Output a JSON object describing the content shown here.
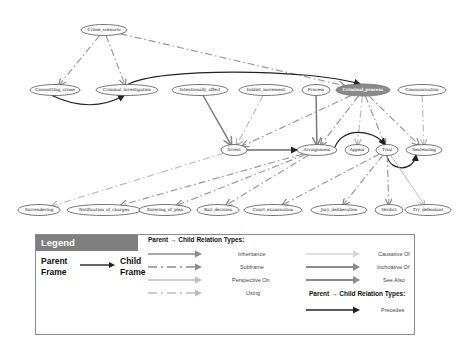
{
  "diagram": {
    "nodes": [
      {
        "id": "crime_scenario",
        "label": "Crime_scenario",
        "x": 104,
        "y": 30,
        "rx": 23,
        "ry": 5.5
      },
      {
        "id": "committing_crime",
        "label": "Committing_crime",
        "x": 55,
        "y": 90,
        "rx": 25,
        "ry": 5.5
      },
      {
        "id": "criminal_investigation",
        "label": "Criminal_investigation",
        "x": 127,
        "y": 90,
        "rx": 31,
        "ry": 5.5
      },
      {
        "id": "intentionally_affect",
        "label": "Intentionally_affect",
        "x": 200,
        "y": 90,
        "rx": 28,
        "ry": 5.5
      },
      {
        "id": "inhibit_movement",
        "label": "Inhibit_movement",
        "x": 266,
        "y": 90,
        "rx": 27,
        "ry": 5.5
      },
      {
        "id": "process",
        "label": "Process",
        "x": 316,
        "y": 90,
        "rx": 14,
        "ry": 5.5
      },
      {
        "id": "criminal_process",
        "label": "Criminal_process",
        "x": 363,
        "y": 90,
        "rx": 27,
        "ry": 6,
        "highlight": true
      },
      {
        "id": "communication",
        "label": "Communication",
        "x": 422,
        "y": 90,
        "rx": 24,
        "ry": 5.5
      },
      {
        "id": "arrest",
        "label": "Arrest",
        "x": 234,
        "y": 150,
        "rx": 13,
        "ry": 5.5
      },
      {
        "id": "arraignment",
        "label": "Arraignment",
        "x": 317,
        "y": 150,
        "rx": 20,
        "ry": 5.5
      },
      {
        "id": "appeal",
        "label": "Appeal",
        "x": 357,
        "y": 150,
        "rx": 12,
        "ry": 5.5
      },
      {
        "id": "trial",
        "label": "Trial",
        "x": 387,
        "y": 150,
        "rx": 11,
        "ry": 5.5
      },
      {
        "id": "sentencing",
        "label": "Sentencing",
        "x": 424,
        "y": 150,
        "rx": 18,
        "ry": 5.5
      },
      {
        "id": "surrendering",
        "label": "Surrendering",
        "x": 39,
        "y": 210,
        "rx": 21,
        "ry": 5.5
      },
      {
        "id": "notification_of_charges",
        "label": "Notification_of_charges",
        "x": 104,
        "y": 210,
        "rx": 37,
        "ry": 5.5
      },
      {
        "id": "entering_of_plea",
        "label": "Entering_of_plea",
        "x": 165,
        "y": 210,
        "rx": 26,
        "ry": 5.5
      },
      {
        "id": "bail_decision",
        "label": "Bail_decision",
        "x": 218,
        "y": 210,
        "rx": 21,
        "ry": 5.5
      },
      {
        "id": "court_examination",
        "label": "Court_examination",
        "x": 273,
        "y": 210,
        "rx": 29,
        "ry": 5.5
      },
      {
        "id": "jury_deliberation",
        "label": "Jury_deliberation",
        "x": 339,
        "y": 210,
        "rx": 28,
        "ry": 5.5
      },
      {
        "id": "verdict",
        "label": "Verdict",
        "x": 389,
        "y": 210,
        "rx": 14,
        "ry": 5.5
      },
      {
        "id": "try_defendant",
        "label": "Try_defendant",
        "x": 428,
        "y": 210,
        "rx": 23,
        "ry": 5.5
      }
    ],
    "edges": [
      {
        "from": "crime_scenario",
        "to": "committing_crime",
        "type": "subframe"
      },
      {
        "from": "crime_scenario",
        "to": "criminal_investigation",
        "type": "subframe"
      },
      {
        "from": "crime_scenario",
        "to": "criminal_process",
        "type": "subframe"
      },
      {
        "from": "committing_crime",
        "to": "criminal_investigation",
        "type": "precedes"
      },
      {
        "from": "criminal_investigation",
        "to": "criminal_process",
        "type": "precedes"
      },
      {
        "from": "intentionally_affect",
        "to": "arrest",
        "type": "inheritance"
      },
      {
        "from": "inhibit_movement",
        "to": "arrest",
        "type": "using"
      },
      {
        "from": "process",
        "to": "arraignment",
        "type": "inheritance"
      },
      {
        "from": "criminal_process",
        "to": "arrest",
        "type": "subframe"
      },
      {
        "from": "criminal_process",
        "to": "arraignment",
        "type": "subframe"
      },
      {
        "from": "criminal_process",
        "to": "appeal",
        "type": "using"
      },
      {
        "from": "criminal_process",
        "to": "trial",
        "type": "subframe"
      },
      {
        "from": "criminal_process",
        "to": "sentencing",
        "type": "subframe"
      },
      {
        "from": "communication",
        "to": "sentencing",
        "type": "using"
      },
      {
        "from": "arrest",
        "to": "arraignment",
        "type": "precedes"
      },
      {
        "from": "arraignment",
        "to": "trial",
        "type": "precedes"
      },
      {
        "from": "trial",
        "to": "sentencing",
        "type": "precedes"
      },
      {
        "from": "arrest",
        "to": "surrendering",
        "type": "using"
      },
      {
        "from": "arraignment",
        "to": "notification_of_charges",
        "type": "subframe"
      },
      {
        "from": "arraignment",
        "to": "entering_of_plea",
        "type": "subframe"
      },
      {
        "from": "arraignment",
        "to": "bail_decision",
        "type": "subframe"
      },
      {
        "from": "trial",
        "to": "court_examination",
        "type": "subframe"
      },
      {
        "from": "trial",
        "to": "jury_deliberation",
        "type": "subframe"
      },
      {
        "from": "trial",
        "to": "verdict",
        "type": "subframe"
      },
      {
        "from": "trial",
        "to": "try_defendant",
        "type": "causative"
      }
    ]
  },
  "legend": {
    "header": "Legend",
    "parent_frame": "Parent Frame",
    "parent_line1": "Parent",
    "parent_line2": "Frame",
    "child_line1": "Child",
    "child_line2": "Frame",
    "section_title": "Parent → Child Relation Types:",
    "section_title_2": "Parent → Child Relation Types:",
    "items": [
      {
        "label": "Inheritance",
        "type": "inheritance",
        "color": "#8c8c8c"
      },
      {
        "label": "Subframe",
        "type": "subframe",
        "color": "#8c8c8c"
      },
      {
        "label": "Perspective On",
        "type": "perspective",
        "color": "#bdbdbd"
      },
      {
        "label": "Using",
        "type": "using",
        "color": "#bdbdbd"
      },
      {
        "label": "Causative Of",
        "type": "causative",
        "color": "#d4d4d4"
      },
      {
        "label": "Inchoative Of",
        "type": "inchoative",
        "color": "#8c8c8c"
      },
      {
        "label": "See Also",
        "type": "see_also",
        "color": "#8c8c8c"
      },
      {
        "label": "Precedes",
        "type": "precedes",
        "color": "#222222"
      }
    ]
  },
  "colors": {
    "header_bg": "#7f7f7f",
    "highlight_node": "#8a8a8a",
    "precedes": "#222222",
    "inheritance": "#777777",
    "subframe": "#999999",
    "using": "#bdbdbd",
    "causative": "#c8c8c8"
  }
}
